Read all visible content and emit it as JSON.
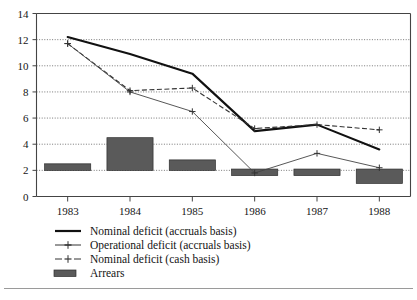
{
  "chart_data": {
    "type": "line",
    "title": "",
    "xlabel": "",
    "ylabel": "",
    "categories": [
      "1983",
      "1984",
      "1985",
      "1986",
      "1987",
      "1988"
    ],
    "ylim": [
      0,
      14
    ],
    "yticks": [
      0,
      2,
      4,
      6,
      8,
      10,
      12,
      14
    ],
    "grid": true,
    "legend_position": "below-left",
    "series": [
      {
        "name": "Nominal deficit (accruals basis)",
        "type": "line",
        "style": "solid-thick",
        "values": [
          12.2,
          10.9,
          9.4,
          5.0,
          5.5,
          3.6
        ]
      },
      {
        "name": "Operational deficit (accruals basis)",
        "type": "line",
        "style": "solid-thin-plus-markers",
        "values": [
          11.7,
          8.0,
          6.5,
          1.8,
          3.3,
          2.2
        ]
      },
      {
        "name": "Nominal deficit (cash basis)",
        "type": "line",
        "style": "dashed-plus-markers",
        "values": [
          11.7,
          8.1,
          8.3,
          5.2,
          5.5,
          5.1
        ]
      },
      {
        "name": "Arrears",
        "type": "bar-range",
        "bars": [
          {
            "category": "1983",
            "bottom": 2.0,
            "top": 2.5
          },
          {
            "category": "1984",
            "bottom": 2.0,
            "top": 4.5
          },
          {
            "category": "1985",
            "bottom": 2.0,
            "top": 2.8
          },
          {
            "category": "1986",
            "bottom": 1.6,
            "top": 2.1
          },
          {
            "category": "1987",
            "bottom": 1.6,
            "top": 2.1
          },
          {
            "category": "1988",
            "bottom": 1.0,
            "top": 2.1
          }
        ]
      }
    ]
  },
  "axis": {
    "y_tick_labels": [
      "0",
      "2",
      "4",
      "6",
      "8",
      "10",
      "12",
      "14"
    ],
    "x_tick_labels": [
      "1983",
      "1984",
      "1985",
      "1986",
      "1987",
      "1988"
    ]
  },
  "legend": {
    "items": [
      {
        "label": "Nominal deficit (accruals basis)",
        "key": "solid-thick-line-key"
      },
      {
        "label": "Operational deficit (accruals basis)",
        "key": "thin-line-plus-marker-key"
      },
      {
        "label": "Nominal deficit (cash basis)",
        "key": "dashed-line-plus-marker-key"
      },
      {
        "label": "Arrears",
        "key": "filled-bar-swatch-key"
      }
    ]
  },
  "colors": {
    "series_nominal_accruals": "#111111",
    "series_operational": "#444444",
    "series_cash": "#333333",
    "bar_arrears_fill": "#5a5a5a",
    "grid": "#555555",
    "axis": "#444444",
    "background": "#ffffff"
  }
}
